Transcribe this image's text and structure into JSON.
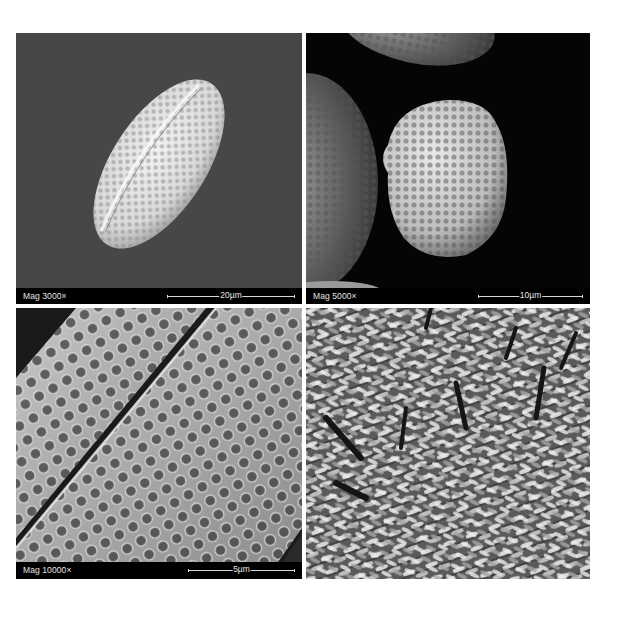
{
  "figure": {
    "panels": [
      {
        "id": "top-left",
        "content": "SEM micrograph of ellipsoid pollen grain with reticulate surface",
        "magnification": "Mag 3000×",
        "scale_bar": "20µm",
        "background": "#474747"
      },
      {
        "id": "top-right",
        "content": "SEM micrograph of rounded pollen grain with neighbouring grains",
        "magnification": "Mag 5000×",
        "scale_bar": "10µm",
        "background": "#050505"
      },
      {
        "id": "bottom-left",
        "content": "SEM close-up of reticulate pollen exine surface",
        "magnification": "Mag 10000×",
        "scale_bar": "5µm",
        "background": "#1a1a1a"
      },
      {
        "id": "bottom-right",
        "content": "Photograph of flowering shrub with pinnate leaves and spike inflorescences",
        "background": "#6e6e6e"
      }
    ]
  }
}
